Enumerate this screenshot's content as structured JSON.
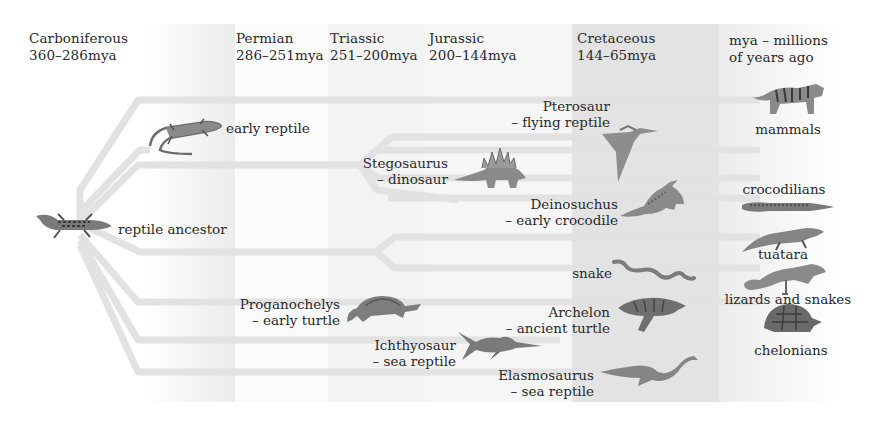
{
  "periods": [
    {
      "name": "Carboniferous",
      "range": "360–286mya"
    },
    {
      "name": "Permian",
      "range": "286–251mya"
    },
    {
      "name": "Triassic",
      "range": "251–200mya"
    },
    {
      "name": "Jurassic",
      "range": "200–144mya"
    },
    {
      "name": "Cretaceous",
      "range": "144–65mya"
    }
  ],
  "legend": {
    "line1": "mya – millions",
    "line2": "of years ago"
  },
  "ancestor": {
    "label": "reptile ancestor",
    "icon": "lizard-icon"
  },
  "extinct": [
    {
      "name": "early reptile",
      "desc": "",
      "icon": "lizard-icon"
    },
    {
      "name": "Pterosaur",
      "desc": "– flying reptile",
      "icon": "pterosaur-icon"
    },
    {
      "name": "Stegosaurus",
      "desc": "– dinosaur",
      "icon": "stegosaurus-icon"
    },
    {
      "name": "Deinosuchus",
      "desc": "– early crocodile",
      "icon": "crocodile-icon"
    },
    {
      "name": "snake",
      "desc": "",
      "icon": "snake-icon"
    },
    {
      "name": "Proganochelys",
      "desc": "– early turtle",
      "icon": "turtle-icon"
    },
    {
      "name": "Archelon",
      "desc": "– ancient turtle",
      "icon": "sea-turtle-icon"
    },
    {
      "name": "Ichthyosaur",
      "desc": "– sea reptile",
      "icon": "ichthyosaur-icon"
    },
    {
      "name": "Elasmosaurus",
      "desc": "– sea reptile",
      "icon": "plesiosaur-icon"
    }
  ],
  "living": [
    {
      "name": "mammals",
      "icon": "tiger-icon"
    },
    {
      "name": "crocodilians",
      "icon": "crocodile-icon"
    },
    {
      "name": "tuatara",
      "icon": "tuatara-icon"
    },
    {
      "name": "lizards and snakes",
      "icon": "iguana-icon"
    },
    {
      "name": "chelonians",
      "icon": "tortoise-icon"
    }
  ],
  "colors": {
    "branch": "#e4e4e4",
    "cretaceous_band": "#e3e3e3",
    "text": "#2a2a2a"
  }
}
